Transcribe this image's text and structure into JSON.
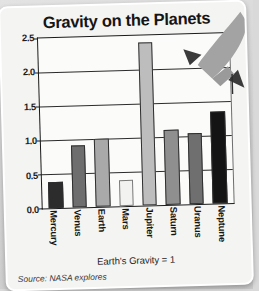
{
  "card": {
    "footnote": "Earth's Gravity = 1",
    "source": "Source: NASA explores"
  },
  "decor": {
    "rocket_label": "rocket-illustration"
  },
  "chart_data": {
    "type": "bar",
    "title": "Gravity on the Planets",
    "xlabel": "",
    "ylabel": "",
    "ylim": [
      0.0,
      2.5
    ],
    "grid": true,
    "legend": false,
    "categories": [
      "Mercury",
      "Venus",
      "Earth",
      "Mars",
      "Jupiter",
      "Saturn",
      "Uranus",
      "Neptune"
    ],
    "values": [
      0.38,
      0.91,
      1.0,
      0.38,
      2.4,
      1.1,
      1.05,
      1.35
    ],
    "ytick_labels": [
      "0.0",
      "0.5",
      "1.0",
      "1.5",
      "2.0",
      "2.5"
    ],
    "ytick_values": [
      0.0,
      0.5,
      1.0,
      1.5,
      2.0,
      2.5
    ],
    "bar_colors": [
      "#2c2c2c",
      "#6e6e6e",
      "#a9a9a9",
      "#f2f2f0",
      "#bdbdbd",
      "#8f8f8f",
      "#6f6f6f",
      "#141414"
    ],
    "annotations": [
      "Earth's Gravity = 1"
    ]
  }
}
